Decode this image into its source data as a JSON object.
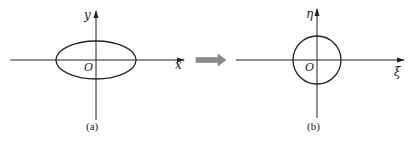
{
  "panels": [
    {
      "id": "a",
      "caption": "(a)",
      "shape": "ellipse",
      "axis_x_label": "x",
      "axis_y_label": "y",
      "origin_label": "O"
    },
    {
      "id": "b",
      "caption": "(b)",
      "shape": "circle",
      "axis_x_label": "ξ",
      "axis_y_label": "η",
      "origin_label": "O"
    }
  ],
  "transform_arrow": {
    "color": "#8a8a8a",
    "direction": "right"
  },
  "colors": {
    "stroke": "#222222",
    "background": "#ffffff"
  }
}
